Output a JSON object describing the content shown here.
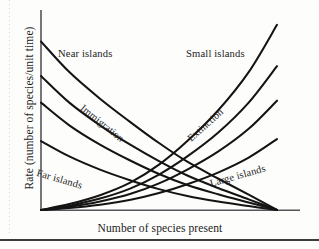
{
  "figure": {
    "background_color": "#fdfdfc",
    "ink_color": "#141414",
    "axis_color": "#55555a"
  },
  "chart_data": {
    "type": "line",
    "title": "",
    "subtitle": "",
    "xlabel": "Number of species present",
    "ylabel": "Rate (number of species/unit time)",
    "xlim": [
      0,
      1
    ],
    "ylim": [
      0,
      1
    ],
    "grid": false,
    "ticks": {
      "x": [],
      "y": []
    },
    "legend_position": "inline-annotations",
    "annotations": [
      {
        "text": "Near islands",
        "role": "immigration-curve-group-top",
        "rotation_deg": 0
      },
      {
        "text": "Far islands",
        "role": "immigration-curve-group-bottom",
        "rotation_deg": 16
      },
      {
        "text": "Immigration",
        "role": "curve-family-name-left",
        "rotation_deg": 39
      },
      {
        "text": "Extinction",
        "role": "curve-family-name-right",
        "rotation_deg": -42
      },
      {
        "text": "Small islands",
        "role": "extinction-curve-group-top",
        "rotation_deg": 0
      },
      {
        "text": "Large islands",
        "role": "extinction-curve-group-bottom",
        "rotation_deg": -16
      }
    ],
    "series": [
      {
        "name": "Immigration - near islands",
        "family": "immigration",
        "direction": "decreasing-convex",
        "x": [
          0.0,
          0.12,
          0.25,
          0.38,
          0.5,
          0.62,
          0.75,
          0.88,
          1.0
        ],
        "y": [
          0.855,
          0.7,
          0.565,
          0.445,
          0.34,
          0.245,
          0.16,
          0.078,
          0.0
        ]
      },
      {
        "name": "Immigration - intermediate A",
        "family": "immigration",
        "direction": "decreasing-convex",
        "x": [
          0.0,
          0.12,
          0.25,
          0.38,
          0.5,
          0.62,
          0.75,
          0.88,
          1.0
        ],
        "y": [
          0.68,
          0.545,
          0.43,
          0.33,
          0.248,
          0.175,
          0.112,
          0.054,
          0.0
        ]
      },
      {
        "name": "Immigration - intermediate B",
        "family": "immigration",
        "direction": "decreasing-convex",
        "x": [
          0.0,
          0.12,
          0.25,
          0.38,
          0.5,
          0.62,
          0.75,
          0.88,
          1.0
        ],
        "y": [
          0.545,
          0.43,
          0.332,
          0.25,
          0.183,
          0.127,
          0.08,
          0.038,
          0.0
        ]
      },
      {
        "name": "Immigration - far islands",
        "family": "immigration",
        "direction": "decreasing-convex",
        "x": [
          0.0,
          0.12,
          0.25,
          0.38,
          0.5,
          0.62,
          0.75,
          0.88,
          1.0
        ],
        "y": [
          0.35,
          0.272,
          0.205,
          0.15,
          0.106,
          0.071,
          0.043,
          0.02,
          0.0
        ]
      },
      {
        "name": "Extinction - small islands",
        "family": "extinction",
        "direction": "increasing-convex",
        "x": [
          0.0,
          0.12,
          0.25,
          0.38,
          0.5,
          0.62,
          0.75,
          0.88,
          1.0
        ],
        "y": [
          0.0,
          0.03,
          0.075,
          0.14,
          0.23,
          0.35,
          0.505,
          0.7,
          0.94
        ]
      },
      {
        "name": "Extinction - intermediate A",
        "family": "extinction",
        "direction": "increasing-convex",
        "x": [
          0.0,
          0.12,
          0.25,
          0.38,
          0.5,
          0.62,
          0.75,
          0.88,
          1.0
        ],
        "y": [
          0.0,
          0.022,
          0.058,
          0.11,
          0.18,
          0.272,
          0.392,
          0.545,
          0.73
        ]
      },
      {
        "name": "Extinction - intermediate B",
        "family": "extinction",
        "direction": "increasing-convex",
        "x": [
          0.0,
          0.12,
          0.25,
          0.38,
          0.5,
          0.62,
          0.75,
          0.88,
          1.0
        ],
        "y": [
          0.0,
          0.016,
          0.043,
          0.082,
          0.135,
          0.205,
          0.296,
          0.412,
          0.555
        ]
      },
      {
        "name": "Extinction - large islands",
        "family": "extinction",
        "direction": "increasing-convex",
        "x": [
          0.0,
          0.12,
          0.25,
          0.38,
          0.5,
          0.62,
          0.75,
          0.88,
          1.0
        ],
        "y": [
          0.0,
          0.01,
          0.027,
          0.052,
          0.086,
          0.131,
          0.19,
          0.266,
          0.36
        ]
      }
    ]
  }
}
